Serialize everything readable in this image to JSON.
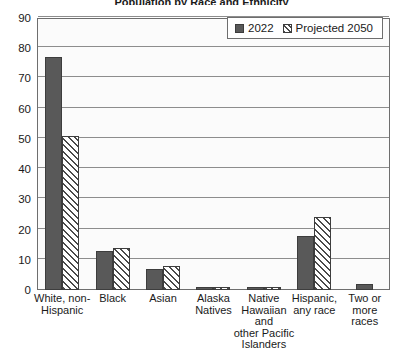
{
  "title_sliver": "Population by Race and Ethnicity",
  "legend": {
    "position": "top-right",
    "entries": [
      {
        "label": "2022",
        "swatch": "solid-dark-gray"
      },
      {
        "label": "Projected 2050",
        "swatch": "diagonal-hatch"
      }
    ]
  },
  "axis": {
    "y_ticks": [
      "0",
      "10",
      "20",
      "30",
      "40",
      "50",
      "60",
      "70",
      "80",
      "90"
    ]
  },
  "chart_data": {
    "type": "bar",
    "title": "Population by Race and Ethnicity",
    "subtitle": "",
    "xlabel": "",
    "ylabel": "",
    "ylim": [
      0,
      90
    ],
    "ytick_step": 10,
    "grid": true,
    "legend_position": "top-right",
    "categories": [
      "White, non-Hispanic",
      "Black",
      "Asian",
      "Alaska Natives",
      "Native Hawaiian and other Pacific Islanders",
      "Hispanic, any race",
      "Two or more races"
    ],
    "category_lines": [
      [
        "White, non-",
        "Hispanic"
      ],
      [
        "Black"
      ],
      [
        "Asian"
      ],
      [
        "Alaska",
        "Natives"
      ],
      [
        "Native",
        "Hawaiian",
        "and",
        "other Pacific",
        "Islanders"
      ],
      [
        "Hispanic,",
        "any race"
      ],
      [
        "Two or",
        "more",
        "races"
      ]
    ],
    "series": [
      {
        "name": "2022",
        "values": [
          77,
          13,
          7,
          1,
          1,
          18,
          2
        ]
      },
      {
        "name": "Projected 2050",
        "values": [
          51,
          14,
          8,
          1,
          1,
          24,
          null
        ]
      }
    ]
  }
}
